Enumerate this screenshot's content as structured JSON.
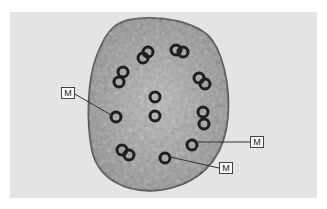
{
  "image": {
    "description": "Electron micrograph cross-section of a cell containing paired microtubule doublets",
    "labels": [
      {
        "text": "M",
        "box": [
          61,
          88
        ],
        "pointer_to": [
          113,
          118
        ]
      },
      {
        "text": "M",
        "box": [
          250,
          137
        ],
        "pointer_to": [
          198,
          142
        ]
      },
      {
        "text": "M",
        "box": [
          219,
          163
        ],
        "pointer_to": [
          170,
          157
        ]
      }
    ]
  }
}
